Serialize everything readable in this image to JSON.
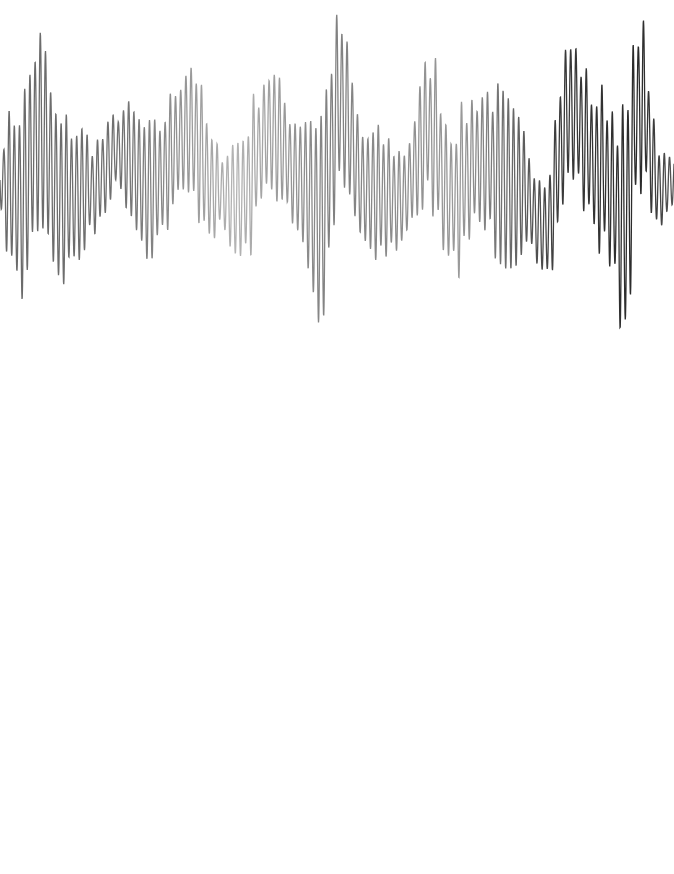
{
  "canvas": {
    "width": 674,
    "height": 874,
    "background": "#ffffff"
  },
  "waveform": {
    "description": "dense oscillating grayscale waveform stroke",
    "top": 0,
    "height": 350,
    "stroke_width": 1.3,
    "color_stops": [
      {
        "x": 0,
        "color": "#6a6a6a"
      },
      {
        "x": 120,
        "color": "#707070"
      },
      {
        "x": 235,
        "color": "#b4b4b4"
      },
      {
        "x": 330,
        "color": "#808080"
      },
      {
        "x": 460,
        "color": "#9a9a9a"
      },
      {
        "x": 560,
        "color": "#3a3a3a"
      },
      {
        "x": 640,
        "color": "#2a2a2a"
      },
      {
        "x": 674,
        "color": "#555555"
      }
    ],
    "envelope": [
      {
        "x": 0,
        "center": 180,
        "amp": 60
      },
      {
        "x": 20,
        "center": 200,
        "amp": 110
      },
      {
        "x": 40,
        "center": 130,
        "amp": 120
      },
      {
        "x": 60,
        "center": 200,
        "amp": 100
      },
      {
        "x": 90,
        "center": 190,
        "amp": 80
      },
      {
        "x": 120,
        "center": 150,
        "amp": 70
      },
      {
        "x": 150,
        "center": 190,
        "amp": 80
      },
      {
        "x": 190,
        "center": 130,
        "amp": 80
      },
      {
        "x": 215,
        "center": 190,
        "amp": 60
      },
      {
        "x": 240,
        "center": 200,
        "amp": 110
      },
      {
        "x": 270,
        "center": 130,
        "amp": 90
      },
      {
        "x": 300,
        "center": 180,
        "amp": 90
      },
      {
        "x": 320,
        "center": 220,
        "amp": 120
      },
      {
        "x": 340,
        "center": 100,
        "amp": 100
      },
      {
        "x": 365,
        "center": 190,
        "amp": 80
      },
      {
        "x": 400,
        "center": 200,
        "amp": 90
      },
      {
        "x": 430,
        "center": 130,
        "amp": 100
      },
      {
        "x": 450,
        "center": 200,
        "amp": 90
      },
      {
        "x": 480,
        "center": 160,
        "amp": 90
      },
      {
        "x": 520,
        "center": 190,
        "amp": 100
      },
      {
        "x": 545,
        "center": 230,
        "amp": 110
      },
      {
        "x": 570,
        "center": 110,
        "amp": 90
      },
      {
        "x": 600,
        "center": 170,
        "amp": 100
      },
      {
        "x": 625,
        "center": 220,
        "amp": 110
      },
      {
        "x": 640,
        "center": 100,
        "amp": 110
      },
      {
        "x": 660,
        "center": 190,
        "amp": 60
      },
      {
        "x": 674,
        "center": 180,
        "amp": 50
      }
    ],
    "oscillation_period_px": 5.2,
    "samples_per_px": 4
  }
}
